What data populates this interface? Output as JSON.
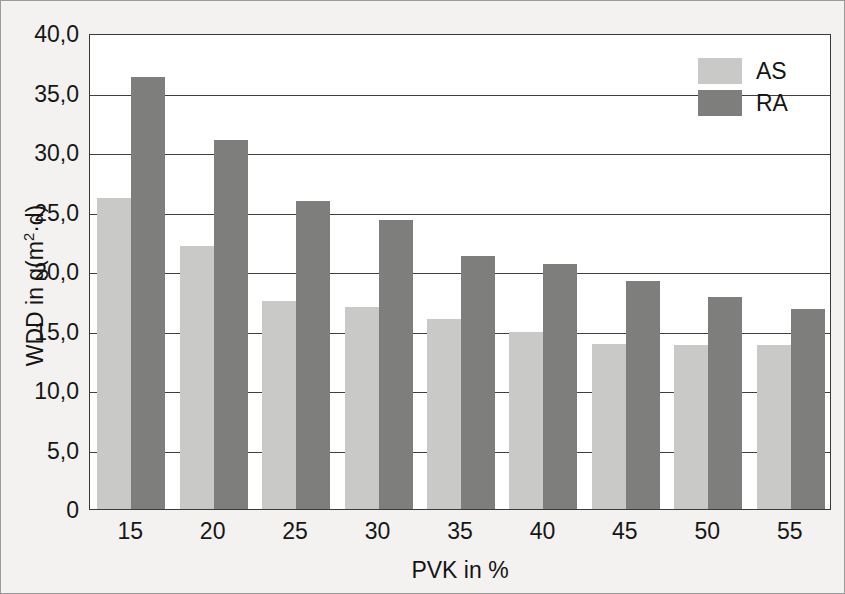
{
  "chart_data": {
    "type": "bar",
    "title": "",
    "xlabel": "PVK in %",
    "ylabel": "WDD in g(m²·d)",
    "ylabel_parts": {
      "pre": "WDD in g(m",
      "sup": "2",
      "post": "·d)"
    },
    "categories": [
      "15",
      "20",
      "25",
      "30",
      "35",
      "40",
      "45",
      "50",
      "55"
    ],
    "series": [
      {
        "name": "AS",
        "color": "#c9c9c7",
        "values": [
          26.1,
          22.1,
          17.5,
          17.0,
          16.0,
          14.9,
          13.9,
          13.8,
          13.8
        ]
      },
      {
        "name": "RA",
        "color": "#7e7e7c",
        "values": [
          36.3,
          31.0,
          25.9,
          24.3,
          21.3,
          20.6,
          19.2,
          17.8,
          16.8
        ]
      }
    ],
    "ylim": [
      0,
      40
    ],
    "ytick_values": [
      0,
      5,
      10,
      15,
      20,
      25,
      30,
      35,
      40
    ],
    "ytick_labels": [
      "0",
      "5,0",
      "10,0",
      "15,0",
      "20,0",
      "25,0",
      "30,0",
      "35,0",
      "40,0"
    ],
    "grid": true,
    "grid_axis": "y",
    "legend_position": "top-right",
    "decimal_separator": ","
  }
}
